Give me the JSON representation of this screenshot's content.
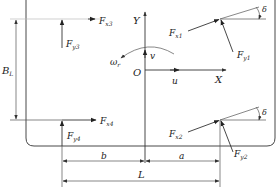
{
  "figure": {
    "body_outline": "rounded-rectangle"
  },
  "axes": {
    "origin": "O",
    "x_axis": "X",
    "y_axis": "Y"
  },
  "velocities": {
    "longitudinal": "u",
    "lateral": "v",
    "yaw_rate": {
      "symbol": "ω",
      "subscript": "r"
    }
  },
  "forces": {
    "front_left": {
      "fx": {
        "symbol": "F",
        "subscript": "x1"
      },
      "fy": {
        "symbol": "F",
        "subscript": "y1"
      },
      "steer_angle": "δ"
    },
    "front_right": {
      "fx": {
        "symbol": "F",
        "subscript": "x2"
      },
      "fy": {
        "symbol": "F",
        "subscript": "y2"
      },
      "steer_angle": "δ"
    },
    "rear_left": {
      "fx": {
        "symbol": "F",
        "subscript": "x3"
      },
      "fy": {
        "symbol": "F",
        "subscript": "y3"
      }
    },
    "rear_right": {
      "fx": {
        "symbol": "F",
        "subscript": "x4"
      },
      "fy": {
        "symbol": "F",
        "subscript": "y4"
      }
    }
  },
  "dimensions": {
    "track_width": {
      "symbol": "B",
      "subscript": "L"
    },
    "rear_to_cg": "b",
    "front_to_cg": "a",
    "wheelbase": "L"
  },
  "colors": {
    "line": "#333333",
    "background": "#ffffff"
  }
}
